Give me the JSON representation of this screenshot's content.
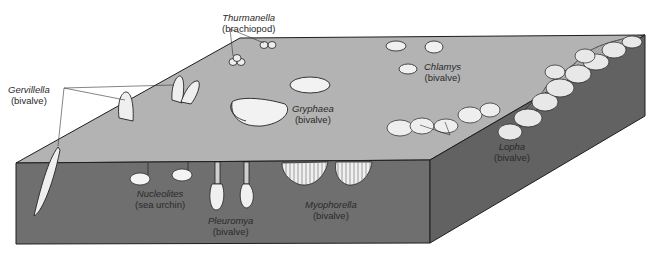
{
  "figure": {
    "type": "block-diagram",
    "colors": {
      "top_face": "#b3b3b3",
      "front_face": "#6f6f6f",
      "side_face": "#626262",
      "outline": "#1e1e1e",
      "shell": "#f2f2f2"
    }
  },
  "labels": [
    {
      "id": "thurmanella",
      "genus": "Thurmanella",
      "group": "(brachiopod)"
    },
    {
      "id": "gervillella",
      "genus": "Gervillella",
      "group": "(bivalve)"
    },
    {
      "id": "chlamys",
      "genus": "Chlamys",
      "group": "(bivalve)"
    },
    {
      "id": "gryphaea",
      "genus": "Gryphaea",
      "group": "(bivalve)"
    },
    {
      "id": "lopha",
      "genus": "Lopha",
      "group": "(bivalve)"
    },
    {
      "id": "nucleolites",
      "genus": "Nucleolites",
      "group": "(sea urchin)"
    },
    {
      "id": "pleuromya",
      "genus": "Pleuromya",
      "group": "(bivalve)"
    },
    {
      "id": "mychophorella",
      "genus": "Myophorella",
      "group": "(bivalve)"
    }
  ]
}
